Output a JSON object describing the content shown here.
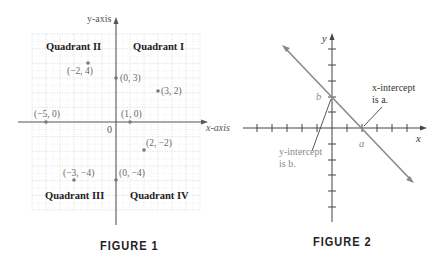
{
  "figure1": {
    "caption": "FIGURE 1",
    "x_axis_label": "x-axis",
    "y_axis_label": "y-axis",
    "origin_label": "0",
    "quadrants": [
      {
        "label": "Quadrant I"
      },
      {
        "label": "Quadrant II"
      },
      {
        "label": "Quadrant III"
      },
      {
        "label": "Quadrant IV"
      }
    ],
    "points": [
      {
        "label": "(−2, 4)",
        "x": -2,
        "y": 4
      },
      {
        "label": "(0, 3)",
        "x": 0,
        "y": 3
      },
      {
        "label": "(3, 2)",
        "x": 3,
        "y": 2
      },
      {
        "label": "(−5, 0)",
        "x": -5,
        "y": 0
      },
      {
        "label": "(1, 0)",
        "x": 1,
        "y": 0
      },
      {
        "label": "(2, −2)",
        "x": 2,
        "y": -2
      },
      {
        "label": "(−3, −4)",
        "x": -3,
        "y": -4
      },
      {
        "label": "(0, −4)",
        "x": 0,
        "y": -4
      }
    ],
    "colors": {
      "grid": "#c8c8c8",
      "axis": "#555555",
      "point": "#7a7a7a",
      "point_label": "#6a6a6a"
    }
  },
  "figure2": {
    "caption": "FIGURE 2",
    "x_axis_label": "x",
    "y_axis_label": "y",
    "a_label": "a",
    "b_label": "b",
    "x_intercept_line1": "x-intercept",
    "x_intercept_line2": "is a.",
    "y_intercept_line1": "y-intercept",
    "y_intercept_line2": "is b.",
    "colors": {
      "line": "#8a8a8a",
      "axis": "#444444",
      "label_gray": "#8a8a8a"
    }
  }
}
